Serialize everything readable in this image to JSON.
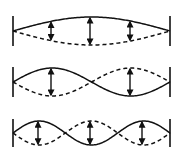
{
  "diagram": {
    "colors": {
      "stroke": "#111111",
      "background": "#ffffff"
    },
    "x_left": 13,
    "x_right": 170,
    "panels": [
      {
        "mode": 1,
        "center_y": 31,
        "amplitude": 14,
        "wall_top": 16,
        "wall_bottom": 46,
        "antinodes_x": [
          51,
          90,
          130
        ]
      },
      {
        "mode": 2,
        "center_y": 82,
        "amplitude": 14,
        "wall_top": 67,
        "wall_bottom": 97,
        "antinodes_x": [
          51,
          130
        ]
      },
      {
        "mode": 3,
        "center_y": 133,
        "amplitude": 12,
        "wall_top": 119,
        "wall_bottom": 147,
        "antinodes_x": [
          38,
          90,
          142
        ]
      }
    ],
    "legend": {
      "solid_line": "string displacement (one extreme)",
      "dashed_line": "string displacement (opposite extreme)",
      "double_arrow": "oscillation amplitude"
    }
  }
}
